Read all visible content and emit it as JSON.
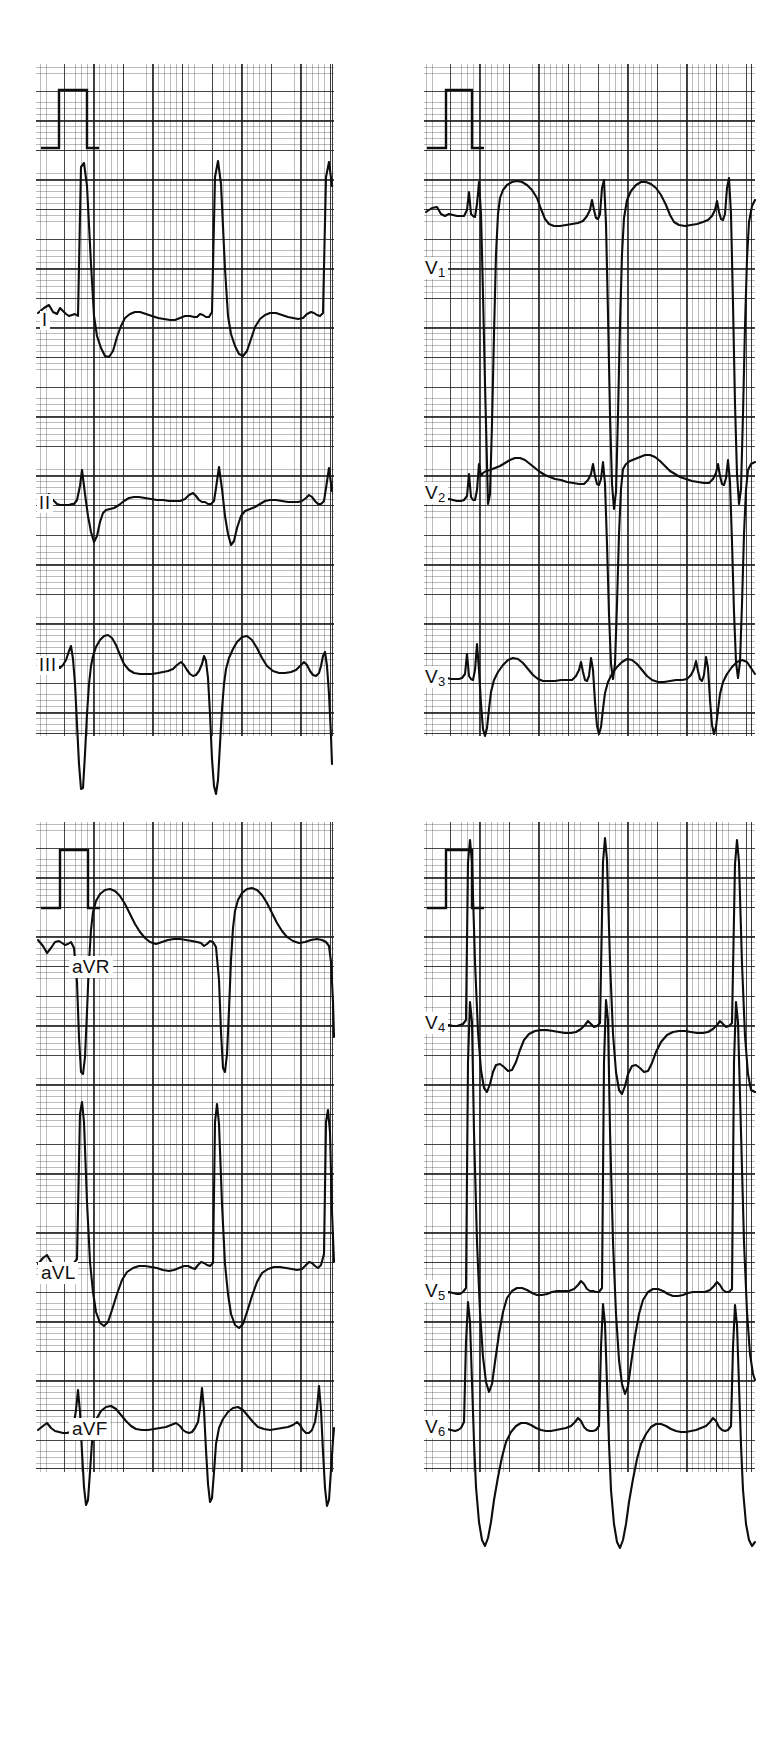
{
  "document": {
    "type": "12-lead electrocardiogram",
    "paper_speed": "25 mm/s",
    "calibration": "1 mV = 10 mm",
    "background": "#ffffff",
    "trace_color": "#0d0d0d",
    "grid_major_color": "#191919",
    "grid_minor_color": "#3c3c3c"
  },
  "panels": [
    {
      "id": "panel-limb-1",
      "position": "top-left",
      "leads": [
        "I",
        "II",
        "III"
      ],
      "has_calibration_pulse": true
    },
    {
      "id": "panel-precordial-1",
      "position": "top-right",
      "leads": [
        "V1",
        "V2",
        "V3"
      ],
      "has_calibration_pulse": true
    },
    {
      "id": "panel-limb-2",
      "position": "bottom-left",
      "leads": [
        "aVR",
        "aVL",
        "aVF"
      ],
      "has_calibration_pulse": true
    },
    {
      "id": "panel-precordial-2",
      "position": "bottom-right",
      "leads": [
        "V4",
        "V5",
        "V6"
      ],
      "has_calibration_pulse": true
    }
  ],
  "leads": {
    "I": {
      "label": "I",
      "label_html": "I"
    },
    "II": {
      "label": "II",
      "label_html": "II"
    },
    "III": {
      "label": "III",
      "label_html": "III"
    },
    "aVR": {
      "label": "aVR",
      "label_html": "aVR"
    },
    "aVL": {
      "label": "aVL",
      "label_html": "aVL"
    },
    "aVF": {
      "label": "aVF",
      "label_html": "aVF"
    },
    "V1": {
      "label": "V1",
      "label_html": "V<sub>1</sub>"
    },
    "V2": {
      "label": "V2",
      "label_html": "V<sub>2</sub>"
    },
    "V3": {
      "label": "V3",
      "label_html": "V<sub>3</sub>"
    },
    "V4": {
      "label": "V4",
      "label_html": "V<sub>4</sub>"
    },
    "V5": {
      "label": "V5",
      "label_html": "V<sub>5</sub>"
    },
    "V6": {
      "label": "V6",
      "label_html": "V<sub>6</sub>"
    }
  },
  "chart_data": {
    "type": "line",
    "xlabel": "time",
    "ylabel": "voltage",
    "grid": true,
    "legend": "none",
    "paper_speed_mm_per_s": 25,
    "calibration_mm_per_mV": 10,
    "grid_small_box_px": 5.92,
    "grid_large_box_px": 29.6,
    "beats_per_strip": 3,
    "calibration_pulse": {
      "amplitude_mV": 1,
      "width_boxes": 1,
      "description": "rectangular 1 mV standardization pulse at start of each panel"
    },
    "series": [
      {
        "name": "I",
        "panel": "panel-limb-1",
        "row": 0,
        "features": "small notched P, very tall narrow R, deep S, downsloping ST with inverted/biphasic T"
      },
      {
        "name": "II",
        "panel": "panel-limb-1",
        "row": 1,
        "features": "upright P, tall R, small S, broad upright T"
      },
      {
        "name": "III",
        "panel": "panel-limb-1",
        "row": 2,
        "features": "small R then very deep S extending below strip, broad upright T"
      },
      {
        "name": "V1",
        "panel": "panel-precordial-1",
        "row": 0,
        "features": "tall broad R, very deep S below strip, dome shaped ST-T"
      },
      {
        "name": "V2",
        "panel": "panel-precordial-1",
        "row": 1,
        "features": "broad R with deep S, elevated coved ST segment"
      },
      {
        "name": "V3",
        "panel": "panel-precordial-1",
        "row": 2,
        "features": "rS complex, low amplitude, upright rounded T"
      },
      {
        "name": "aVR",
        "panel": "panel-limb-2",
        "row": 0,
        "features": "deep QS complex, dome shaped positive ST-T"
      },
      {
        "name": "aVL",
        "panel": "panel-limb-2",
        "row": 1,
        "features": "very tall narrow R, deep S, downsloping ST with negative T"
      },
      {
        "name": "aVF",
        "panel": "panel-limb-2",
        "row": 2,
        "features": "small R, deep narrow S, rounded upright T"
      },
      {
        "name": "V4",
        "panel": "panel-precordial-2",
        "row": 0,
        "features": "very tall R above strip, deep S, flat depressed ST"
      },
      {
        "name": "V5",
        "panel": "panel-precordial-2",
        "row": 1,
        "features": "very tall R, deep wide S, rounded upright T"
      },
      {
        "name": "V6",
        "panel": "panel-precordial-2",
        "row": 2,
        "features": "tall R, deep broad S, rounded upright T"
      }
    ]
  }
}
